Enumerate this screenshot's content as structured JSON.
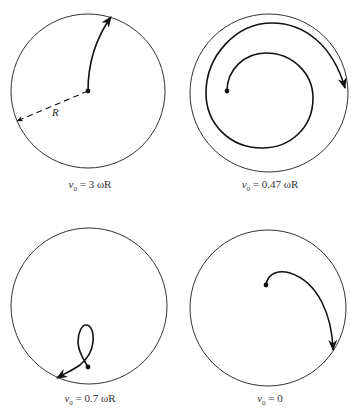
{
  "figure": {
    "panels": [
      {
        "id": "top-left",
        "caption_var": "v",
        "caption_sub": "0",
        "caption_rest": " = 3 ωR",
        "caption": "v0 = 3 ωR",
        "radius_label": "R"
      },
      {
        "id": "top-right",
        "caption_var": "v",
        "caption_sub": "0",
        "caption_rest": " = 0.47 ωR",
        "caption": "v0 = 0.47 ωR"
      },
      {
        "id": "bottom-left",
        "caption_var": "v",
        "caption_sub": "0",
        "caption_rest": " = 0.7 ωR",
        "caption": "v0 = 0.7 ωR"
      },
      {
        "id": "bottom-right",
        "caption_var": "v",
        "caption_sub": "0",
        "caption_rest": " = 0",
        "caption": "v0 = 0"
      }
    ],
    "colors": {
      "circle": "#333333",
      "trajectory": "#111111",
      "background": "#ffffff"
    }
  }
}
